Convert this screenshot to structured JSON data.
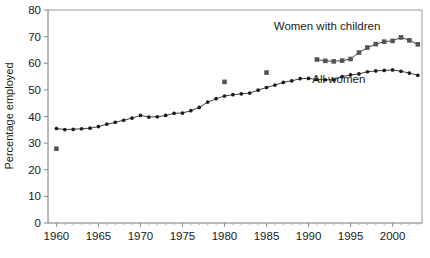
{
  "chart_data": {
    "type": "line",
    "title": "",
    "xlabel": "",
    "ylabel": "Percentage employed",
    "xlim": [
      1959,
      2003.5
    ],
    "ylim": [
      0,
      80
    ],
    "ytick_values": [
      0,
      10,
      20,
      30,
      40,
      50,
      60,
      70,
      80
    ],
    "ytick_labels": [
      "0",
      "10",
      "20",
      "30",
      "40",
      "50",
      "60",
      "70",
      "80"
    ],
    "xtick_values": [
      1960,
      1965,
      1970,
      1975,
      1980,
      1985,
      1990,
      1995,
      2000
    ],
    "xtick_labels": [
      "1960",
      "1965",
      "1970",
      "1975",
      "1980",
      "1985",
      "1990",
      "1995",
      "2000"
    ],
    "x_minor_step": 1,
    "grid": false,
    "legend_position": "inline-annotations",
    "annotations": [
      {
        "text": "Women with children",
        "x": 1992.2,
        "y": 72.4,
        "anchor": "middle",
        "name": "annotation-women-with-children"
      },
      {
        "text": "All women",
        "x": 1993.6,
        "y": 52.4,
        "anchor": "middle",
        "name": "annotation-all-women"
      }
    ],
    "series": [
      {
        "name": "All women",
        "marker": "dot",
        "line": true,
        "x": [
          1960,
          1961,
          1962,
          1963,
          1964,
          1965,
          1966,
          1967,
          1968,
          1969,
          1970,
          1971,
          1972,
          1973,
          1974,
          1975,
          1976,
          1977,
          1978,
          1979,
          1980,
          1981,
          1982,
          1983,
          1984,
          1985,
          1986,
          1987,
          1988,
          1989,
          1990,
          1991,
          1992,
          1993,
          1994,
          1995,
          1996,
          1997,
          1998,
          1999,
          2000,
          2001,
          2002,
          2003
        ],
        "values": [
          35.5,
          35.1,
          35.2,
          35.4,
          35.6,
          36.2,
          37.1,
          37.8,
          38.6,
          39.4,
          40.4,
          39.8,
          39.9,
          40.4,
          41.2,
          41.3,
          42.2,
          43.4,
          45.4,
          46.7,
          47.7,
          48.2,
          48.5,
          48.8,
          49.9,
          50.9,
          51.8,
          52.8,
          53.4,
          54.2,
          54.3,
          53.9,
          53.8,
          53.8,
          55.0,
          55.6,
          56.0,
          56.8,
          57.1,
          57.3,
          57.5,
          57.0,
          56.3,
          55.5
        ],
        "color": "#1c1c1c"
      },
      {
        "name": "Women with children",
        "marker": "square",
        "line": true,
        "x": [
          1991,
          1992,
          1993,
          1994,
          1995,
          1996,
          1997,
          1998,
          1999,
          2000,
          2001,
          2002,
          2003
        ],
        "values": [
          61.4,
          60.9,
          60.7,
          61.0,
          61.6,
          64.0,
          65.9,
          67.2,
          68.1,
          68.4,
          69.7,
          68.6,
          67.1
        ],
        "color": "#555555"
      },
      {
        "name": "Women with children (early observations)",
        "marker": "square",
        "line": false,
        "x": [
          1960,
          1980,
          1985
        ],
        "values": [
          27.9,
          53.0,
          56.5
        ],
        "color": "#555555"
      }
    ]
  },
  "colors": {
    "background": "#ffffff",
    "frame": "#9a9a9a",
    "axis": "#777777",
    "dot_series": "#1c1c1c",
    "square_series": "#555555",
    "text": "#1a1a1a"
  }
}
